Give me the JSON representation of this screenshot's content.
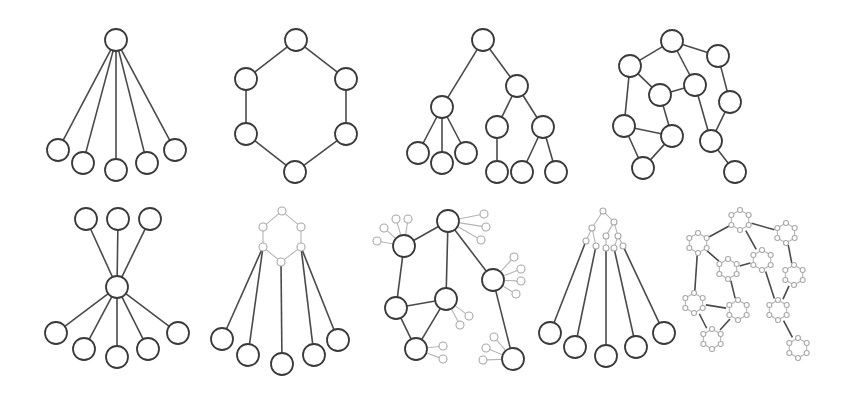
{
  "figure": {
    "width": 847,
    "height": 402,
    "colors": {
      "stroke": "#3a3a3a",
      "edge": "#4a4a4a",
      "light": "#a8a8a8",
      "background": "#ffffff"
    },
    "panels": [
      {
        "name": "star-graph",
        "r": 11,
        "nodes": [
          [
            116,
            40
          ],
          [
            58,
            150
          ],
          [
            83,
            163
          ],
          [
            116,
            170
          ],
          [
            147,
            163
          ],
          [
            175,
            150
          ]
        ],
        "edges": [
          [
            0,
            1
          ],
          [
            0,
            2
          ],
          [
            0,
            3
          ],
          [
            0,
            4
          ],
          [
            0,
            5
          ]
        ]
      },
      {
        "name": "ring-graph",
        "r": 11,
        "nodes": [
          [
            296,
            40
          ],
          [
            246,
            79
          ],
          [
            346,
            79
          ],
          [
            246,
            134
          ],
          [
            346,
            134
          ],
          [
            295,
            172
          ]
        ],
        "edges": [
          [
            0,
            1
          ],
          [
            0,
            2
          ],
          [
            1,
            3
          ],
          [
            2,
            4
          ],
          [
            3,
            5
          ],
          [
            4,
            5
          ]
        ]
      },
      {
        "name": "tree-graph",
        "r": 11,
        "nodes": [
          [
            483,
            40
          ],
          [
            442,
            107
          ],
          [
            517,
            86
          ],
          [
            418,
            153
          ],
          [
            442,
            163
          ],
          [
            466,
            153
          ],
          [
            497,
            127
          ],
          [
            543,
            127
          ],
          [
            497,
            172
          ],
          [
            522,
            172
          ],
          [
            556,
            172
          ]
        ],
        "edges": [
          [
            0,
            1
          ],
          [
            0,
            2
          ],
          [
            1,
            3
          ],
          [
            1,
            4
          ],
          [
            1,
            5
          ],
          [
            2,
            6
          ],
          [
            2,
            7
          ],
          [
            6,
            8
          ],
          [
            7,
            9
          ],
          [
            7,
            10
          ]
        ]
      },
      {
        "name": "network-graph",
        "r": 11,
        "nodes": [
          [
            672,
            41
          ],
          [
            630,
            66
          ],
          [
            718,
            56
          ],
          [
            660,
            95
          ],
          [
            695,
            85
          ],
          [
            730,
            102
          ],
          [
            624,
            126
          ],
          [
            672,
            136
          ],
          [
            711,
            141
          ],
          [
            643,
            168
          ],
          [
            735,
            172
          ]
        ],
        "edges": [
          [
            1,
            0
          ],
          [
            0,
            2
          ],
          [
            0,
            4
          ],
          [
            1,
            3
          ],
          [
            3,
            4
          ],
          [
            2,
            5
          ],
          [
            1,
            6
          ],
          [
            3,
            7
          ],
          [
            4,
            8
          ],
          [
            5,
            8
          ],
          [
            6,
            7
          ],
          [
            6,
            9
          ],
          [
            7,
            9
          ],
          [
            8,
            10
          ]
        ]
      },
      {
        "name": "bowtie-graph",
        "r": 11,
        "nodes": [
          [
            86,
            219
          ],
          [
            118,
            219
          ],
          [
            150,
            219
          ],
          [
            117,
            287
          ],
          [
            56,
            333
          ],
          [
            84,
            349
          ],
          [
            117,
            357
          ],
          [
            148,
            349
          ],
          [
            178,
            333
          ]
        ],
        "edges": [
          [
            0,
            3
          ],
          [
            1,
            3
          ],
          [
            2,
            3
          ],
          [
            3,
            4
          ],
          [
            3,
            5
          ],
          [
            3,
            6
          ],
          [
            3,
            7
          ],
          [
            3,
            8
          ]
        ]
      },
      {
        "name": "star-of-ring-graph",
        "r": 11,
        "small_r": 4,
        "small_nodes": [
          [
            282,
            211
          ],
          [
            263,
            227
          ],
          [
            301,
            227
          ],
          [
            263,
            247
          ],
          [
            301,
            247
          ],
          [
            281,
            262
          ]
        ],
        "small_edges": [
          [
            0,
            1
          ],
          [
            0,
            2
          ],
          [
            1,
            3
          ],
          [
            2,
            4
          ],
          [
            3,
            5
          ],
          [
            4,
            5
          ]
        ],
        "nodes": [
          [
            222,
            339
          ],
          [
            248,
            355
          ],
          [
            282,
            364
          ],
          [
            314,
            355
          ],
          [
            338,
            340
          ]
        ],
        "cross_edges": [
          [
            3,
            0
          ],
          [
            3,
            1
          ],
          [
            5,
            2
          ],
          [
            4,
            3
          ],
          [
            4,
            4
          ]
        ]
      },
      {
        "name": "network-with-satellites-graph",
        "r": 11,
        "small_r": 4,
        "nodes": [
          [
            448,
            221
          ],
          [
            404,
            246
          ],
          [
            493,
            280
          ],
          [
            396,
            308
          ],
          [
            446,
            299
          ],
          [
            416,
            349
          ],
          [
            513,
            359
          ]
        ],
        "edges": [
          [
            0,
            1
          ],
          [
            0,
            4
          ],
          [
            0,
            2
          ],
          [
            1,
            3
          ],
          [
            3,
            4
          ],
          [
            3,
            5
          ],
          [
            4,
            5
          ],
          [
            2,
            6
          ]
        ],
        "satellites": [
          {
            "host": 0,
            "points": [
              [
                484,
                214
              ],
              [
                486,
                227
              ],
              [
                481,
                240
              ]
            ]
          },
          {
            "host": 1,
            "points": [
              [
                377,
                241
              ],
              [
                384,
                228
              ],
              [
                396,
                219
              ],
              [
                408,
                219
              ]
            ]
          },
          {
            "host": 2,
            "points": [
              [
                514,
                257
              ],
              [
                521,
                269
              ],
              [
                521,
                281
              ],
              [
                516,
                294
              ]
            ]
          },
          {
            "host": 4,
            "points": [
              [
                469,
                316
              ],
              [
                460,
                325
              ]
            ]
          },
          {
            "host": 5,
            "points": [
              [
                443,
                346
              ],
              [
                443,
                359
              ]
            ]
          },
          {
            "host": 6,
            "points": [
              [
                494,
                337
              ],
              [
                486,
                348
              ],
              [
                483,
                360
              ]
            ]
          }
        ]
      },
      {
        "name": "star-of-tree-graph",
        "r": 11,
        "small_r": 3,
        "small_nodes": [
          [
            603,
            211
          ],
          [
            592,
            228
          ],
          [
            614,
            222
          ],
          [
            586,
            241
          ],
          [
            596,
            246
          ],
          [
            606,
            236
          ],
          [
            606,
            248
          ],
          [
            618,
            236
          ],
          [
            614,
            248
          ],
          [
            623,
            246
          ]
        ],
        "small_edges": [
          [
            0,
            1
          ],
          [
            0,
            2
          ],
          [
            1,
            3
          ],
          [
            1,
            4
          ],
          [
            2,
            5
          ],
          [
            5,
            6
          ],
          [
            2,
            7
          ],
          [
            7,
            8
          ],
          [
            7,
            9
          ]
        ],
        "nodes": [
          [
            550,
            333
          ],
          [
            575,
            347
          ],
          [
            606,
            356
          ],
          [
            636,
            347
          ],
          [
            664,
            333
          ]
        ],
        "cross_edges": [
          [
            3,
            0
          ],
          [
            4,
            1
          ],
          [
            6,
            2
          ],
          [
            8,
            3
          ],
          [
            9,
            4
          ]
        ]
      },
      {
        "name": "network-of-rings-graph",
        "hex_r": 10,
        "small_r": 2.5,
        "nodes": [
          [
            740,
            220
          ],
          [
            698,
            243
          ],
          [
            786,
            233
          ],
          [
            728,
            269
          ],
          [
            762,
            260
          ],
          [
            794,
            275
          ],
          [
            694,
            303
          ],
          [
            738,
            310
          ],
          [
            778,
            310
          ],
          [
            712,
            339
          ],
          [
            798,
            348
          ]
        ],
        "edges": [
          [
            1,
            0
          ],
          [
            0,
            2
          ],
          [
            0,
            4
          ],
          [
            1,
            3
          ],
          [
            3,
            4
          ],
          [
            2,
            5
          ],
          [
            1,
            6
          ],
          [
            3,
            7
          ],
          [
            4,
            8
          ],
          [
            5,
            8
          ],
          [
            6,
            7
          ],
          [
            6,
            9
          ],
          [
            7,
            9
          ],
          [
            8,
            10
          ]
        ]
      }
    ]
  }
}
